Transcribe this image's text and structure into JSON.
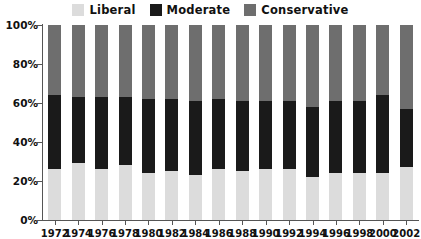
{
  "legend": {
    "items": [
      {
        "label": "Liberal",
        "color": "#dcdcdc",
        "icon": "legend-swatch-liberal"
      },
      {
        "label": "Moderate",
        "color": "#1a1a1a",
        "icon": "legend-swatch-moderate"
      },
      {
        "label": "Conservative",
        "color": "#6e6e6e",
        "icon": "legend-swatch-conservative"
      }
    ]
  },
  "chart_data": {
    "type": "bar",
    "stacked": true,
    "stack_total": 100,
    "title": "",
    "subtitle": "",
    "xlabel": "",
    "ylabel": "",
    "ylim": [
      0,
      100
    ],
    "yticks": [
      "0%",
      "20%",
      "40%",
      "60%",
      "80%",
      "100%"
    ],
    "ytick_values": [
      0,
      20,
      40,
      60,
      80,
      100
    ],
    "grid": false,
    "legend_position": "top-center",
    "categories": [
      "1972",
      "1974",
      "1976",
      "1978",
      "1980",
      "1982",
      "1984",
      "1986",
      "1988",
      "1990",
      "1992",
      "1994",
      "1996",
      "1998",
      "2000",
      "2002"
    ],
    "series": [
      {
        "name": "Liberal",
        "color": "#dcdcdc",
        "values": [
          26,
          29,
          26,
          28,
          24,
          25,
          23,
          26,
          25,
          26,
          26,
          22,
          24,
          24,
          24,
          27
        ]
      },
      {
        "name": "Moderate",
        "color": "#1a1a1a",
        "values": [
          38,
          34,
          37,
          35,
          38,
          37,
          38,
          36,
          36,
          35,
          35,
          36,
          37,
          37,
          40,
          30
        ]
      },
      {
        "name": "Conservative",
        "color": "#6e6e6e",
        "values": [
          36,
          37,
          37,
          37,
          38,
          38,
          39,
          38,
          39,
          39,
          39,
          42,
          39,
          39,
          36,
          43
        ]
      }
    ]
  }
}
